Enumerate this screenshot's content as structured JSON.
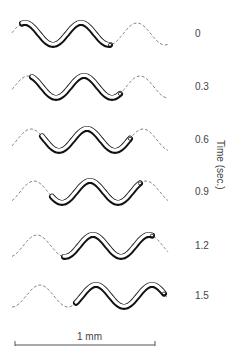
{
  "figure": {
    "type": "nematode locomotion time-lapse diagram",
    "axis_title": "Time (sec.)",
    "frames": [
      {
        "time": "0",
        "y": 34,
        "shift": 0
      },
      {
        "time": "0.3",
        "y": 87,
        "shift": 10
      },
      {
        "time": "0.6",
        "y": 140,
        "shift": 20
      },
      {
        "time": "0.9",
        "y": 192,
        "shift": 30
      },
      {
        "time": "1.2",
        "y": 246,
        "shift": 42
      },
      {
        "time": "1.5",
        "y": 296,
        "shift": 54
      }
    ],
    "scale_bar": {
      "label": "1 mm",
      "x1": 15,
      "x2": 155,
      "y": 345
    },
    "colors": {
      "worm_outline": "#111111",
      "path_dashed": "#666666",
      "text": "#444444"
    }
  }
}
